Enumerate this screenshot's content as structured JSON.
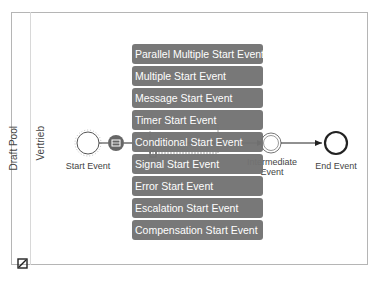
{
  "pool": {
    "label": "Draft Pool"
  },
  "lane": {
    "label": "Vertrieb"
  },
  "events": {
    "start": {
      "label": "Start Event"
    },
    "intermediate": {
      "label_line1": "Intermediate",
      "label_line2": "Event"
    },
    "end": {
      "label": "End Event"
    }
  },
  "context_menu": {
    "items": [
      {
        "label": "Parallel Multiple Start Event"
      },
      {
        "label": "Multiple Start Event"
      },
      {
        "label": "Message Start Event"
      },
      {
        "label": "Timer Start Event"
      },
      {
        "label": "Conditional Start Event"
      },
      {
        "label": "Signal Start Event"
      },
      {
        "label": "Error Start Event"
      },
      {
        "label": "Escalation Start Event"
      },
      {
        "label": "Compensation Start Event"
      }
    ]
  },
  "colors": {
    "menu_bg": "#737373",
    "menu_text": "#ffffff",
    "border": "#b5b5b5",
    "stroke": "#333333"
  }
}
